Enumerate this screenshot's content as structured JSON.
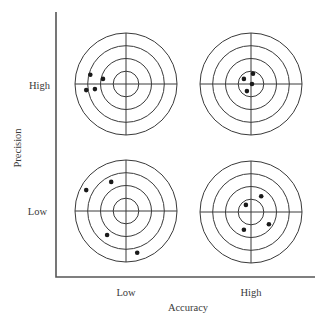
{
  "diagram": {
    "type": "accuracy-precision-targets",
    "y_axis": {
      "label": "Precision",
      "ticks": [
        "High",
        "Low"
      ]
    },
    "x_axis": {
      "label": "Accuracy",
      "ticks": [
        "Low",
        "High"
      ]
    },
    "ring_count": 4,
    "colors": {
      "line": "#3a3a3a",
      "shot": "#1a1a1a",
      "axis": "#555555"
    },
    "targets": [
      {
        "id": "high-precision-low-accuracy",
        "precision": "High",
        "accuracy": "Low",
        "shots": [
          [
            -0.7,
            -0.18
          ],
          [
            -0.45,
            -0.1
          ],
          [
            -0.78,
            0.12
          ],
          [
            -0.61,
            0.1
          ]
        ]
      },
      {
        "id": "high-precision-high-accuracy",
        "precision": "High",
        "accuracy": "High",
        "shots": [
          [
            -0.14,
            -0.1
          ],
          [
            0.04,
            -0.2
          ],
          [
            0.02,
            0.0
          ],
          [
            -0.08,
            0.14
          ]
        ]
      },
      {
        "id": "low-precision-low-accuracy",
        "precision": "Low",
        "accuracy": "Low",
        "shots": [
          [
            -0.78,
            -0.41
          ],
          [
            -0.29,
            -0.57
          ],
          [
            -0.37,
            0.47
          ],
          [
            0.22,
            0.82
          ]
        ]
      },
      {
        "id": "low-precision-high-accuracy",
        "precision": "Low",
        "accuracy": "High",
        "shots": [
          [
            -0.1,
            -0.14
          ],
          [
            0.2,
            -0.31
          ],
          [
            0.35,
            0.24
          ],
          [
            -0.14,
            0.35
          ]
        ]
      }
    ]
  }
}
